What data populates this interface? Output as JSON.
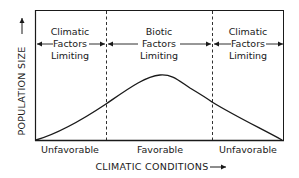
{
  "diagram": {
    "y_axis_label": "POPULATION SIZE",
    "x_axis_label": "CLIMATIC CONDITIONS",
    "regions": [
      {
        "line1": "Climatic",
        "line2": "Factors",
        "line3": "Limiting"
      },
      {
        "line1": "Biotic",
        "line2": "Factors",
        "line3": "Limiting"
      },
      {
        "line1": "Climatic",
        "line2": "Factors",
        "line3": "Limiting"
      }
    ],
    "x_categories": [
      "Unfavorable",
      "Favorable",
      "Unfavorable"
    ],
    "curve": "bell-shaped population response, peaking at favorable climatic conditions",
    "colors": {
      "line": "#1a1a1a",
      "background": "#ffffff"
    }
  }
}
